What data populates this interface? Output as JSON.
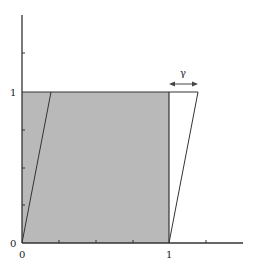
{
  "diagram": {
    "title": "",
    "shear_label": "γ",
    "axis_labels": {
      "x_zero": "0",
      "x_one": "1",
      "y_zero": "0",
      "y_one": "1"
    },
    "colors": {
      "fill": "#b9b9b9",
      "stroke": "#333333",
      "axis": "#333333"
    },
    "shapes": [
      {
        "name": "unit-square",
        "points": [
          [
            0,
            0
          ],
          [
            1,
            0
          ],
          [
            1,
            1
          ],
          [
            0,
            1
          ]
        ],
        "filled": true
      },
      {
        "name": "sheared-parallelogram",
        "points": [
          [
            0,
            0
          ],
          [
            1,
            0
          ],
          [
            1.2,
            1
          ],
          [
            0.2,
            1
          ]
        ],
        "filled": false
      }
    ],
    "gamma": 0.2
  }
}
